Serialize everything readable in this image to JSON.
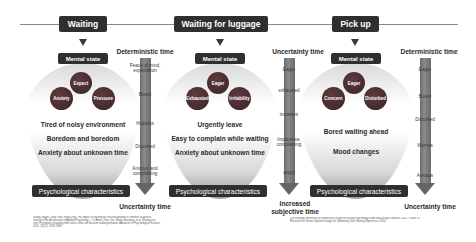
{
  "stages": [
    {
      "title": "Waiting",
      "mental_state_label": "Mental state",
      "moods": [
        "Expect",
        "Anxiety",
        "Pressure"
      ],
      "psych_lines": [
        "Tired of noisy environment",
        "Boredom and boredom",
        "Anxiety about unknown time"
      ],
      "psych_label": "Psychological characteristics",
      "time_column": {
        "title": "Deterministic time",
        "labels": [
          "Peace of mind,\nexpectation",
          "Bored",
          "Helpless",
          "Disturbed",
          "Anxious and\ncomplaining"
        ],
        "footer": "Uncertainty time"
      }
    },
    {
      "title": "Waiting for luggage",
      "mental_state_label": "Mental state",
      "moods": [
        "Eager",
        "Exhausted",
        "Irritability"
      ],
      "psych_lines": [
        "Urgently leave",
        "Easy to complain while waiting",
        "Anxiety about unknown time"
      ],
      "psych_label": "Psychological characteristics",
      "time_column": {
        "title": "Uncertainty time",
        "labels": [
          "Eager",
          "exhausted",
          "impatient",
          "Impatience,\ncomplaining",
          "angry"
        ],
        "footer": "Increased\nsubjective time"
      }
    },
    {
      "title": "Pick up",
      "mental_state_label": "Mental state",
      "moods": [
        "Eager",
        "Concern",
        "Disturbed"
      ],
      "psych_lines": [
        "Bored waiting ahead",
        "Mood changes"
      ],
      "psych_label": "Psychological characteristics",
      "time_column": {
        "title": "Deterministic time",
        "labels": [
          "Eager",
          "Bored",
          "Disturbed",
          "Worries",
          "Anxious"
        ],
        "footer": "Uncertainty time"
      }
    }
  ],
  "references": {
    "left": "Shang Jingjie, Yang Yuan, Fang Ding. The Impact of Waiting on Decision Making in Different Scenarios. Journal of the Association of Applied Psychology... / Li Aimei, Zhou Yan, Wang Guanying, et al. Waiting in a Line: Perception of waiting time and its effect on decision making behavior. Advances in Psychological Science, 2015, 23(11): 1978-1988.",
    "right": "Luo Weifang. Research on Interactive Design for Easing Psychology of Art and Design Chinese, 2015. / Chen Yu. Research on Service System Design for Optimizing User Waiting Experience. 2014."
  },
  "colors": {
    "dark_box": "#2f2f2f",
    "bubble": "#4a2d31",
    "arrow": "#6e6e6e",
    "line": "#8a8a8a"
  }
}
